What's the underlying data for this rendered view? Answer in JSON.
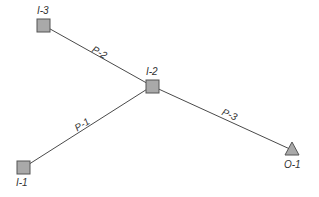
{
  "diagram": {
    "nodes": [
      {
        "id": "I-3",
        "label": "I-3",
        "shape": "square",
        "x": 43,
        "y": 25
      },
      {
        "id": "I-2",
        "label": "I-2",
        "shape": "square",
        "x": 152,
        "y": 86
      },
      {
        "id": "I-1",
        "label": "I-1",
        "shape": "square",
        "x": 23,
        "y": 168
      },
      {
        "id": "O-1",
        "label": "O-1",
        "shape": "triangle",
        "x": 292,
        "y": 150
      }
    ],
    "edges": [
      {
        "id": "P-1",
        "label": "P-1",
        "from": "I-1",
        "to": "I-2"
      },
      {
        "id": "P-2",
        "label": "P-2",
        "from": "I-3",
        "to": "I-2"
      },
      {
        "id": "P-3",
        "label": "P-3",
        "from": "I-2",
        "to": "O-1"
      }
    ],
    "colors": {
      "node_fill": "#a9a9a9",
      "node_stroke": "#555555",
      "edge": "#4a4a4a",
      "text": "#333333"
    }
  }
}
